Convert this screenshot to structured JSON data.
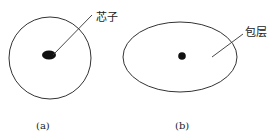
{
  "figure": {
    "panel_a": {
      "caption": "(a)",
      "label": "芯子",
      "shape": "circle"
    },
    "panel_b": {
      "caption": "(b)",
      "label": "包层",
      "shape": "ellipse"
    }
  },
  "colors": {
    "stroke": "#333333",
    "core": "#111111",
    "background": "#ffffff"
  }
}
